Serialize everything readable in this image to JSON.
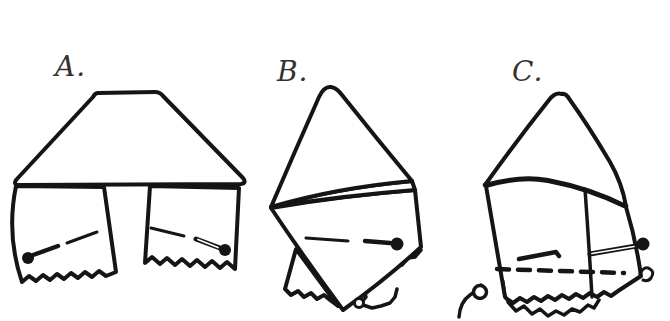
{
  "canvas": {
    "background_color": "#ffffff",
    "ink_color": "#171513",
    "label_color": "#36312e"
  },
  "figures": [
    {
      "label": "A."
    },
    {
      "label": "B."
    },
    {
      "label": "C."
    }
  ]
}
